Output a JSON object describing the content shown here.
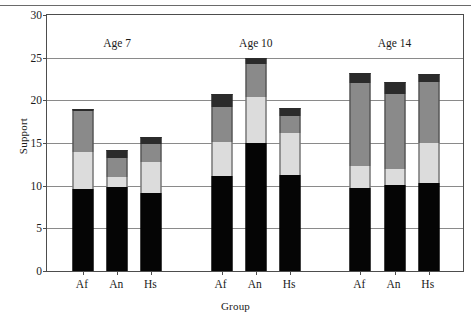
{
  "chart_data": {
    "type": "bar",
    "stacked": true,
    "title": "",
    "xlabel": "Group",
    "ylabel": "Support",
    "ylim": [
      0,
      30
    ],
    "ytick_values": [
      0,
      5,
      10,
      15,
      20,
      25,
      30
    ],
    "ytick_labels": [
      "0",
      "5",
      "10",
      "15",
      "20",
      "25",
      "30"
    ],
    "grid": true,
    "legend": "none",
    "group_labels": [
      "Age 7",
      "Age 10",
      "Age 14"
    ],
    "categories": [
      "Af",
      "An",
      "Hs",
      "Af",
      "An",
      "Hs",
      "Af",
      "An",
      "Hs"
    ],
    "series": [
      {
        "name": "segment-1",
        "color": "#050505",
        "values": [
          9.6,
          9.9,
          9.2,
          11.1,
          15.0,
          11.2,
          9.7,
          10.1,
          10.3
        ]
      },
      {
        "name": "segment-2",
        "color": "#dcdcdc",
        "values": [
          4.4,
          1.1,
          3.6,
          4.0,
          5.4,
          5.0,
          2.6,
          1.9,
          4.7
        ]
      },
      {
        "name": "segment-3",
        "color": "#8a8a8a",
        "values": [
          4.7,
          2.3,
          2.1,
          4.1,
          3.9,
          2.0,
          9.7,
          8.8,
          7.1
        ]
      },
      {
        "name": "segment-4",
        "color": "#2b2b2b",
        "values": [
          0.3,
          0.9,
          0.8,
          1.6,
          0.7,
          0.9,
          1.2,
          1.4,
          1.0
        ]
      }
    ],
    "totals": [
      19.0,
      14.2,
      15.7,
      20.8,
      25.0,
      19.1,
      23.2,
      22.2,
      23.1
    ]
  }
}
